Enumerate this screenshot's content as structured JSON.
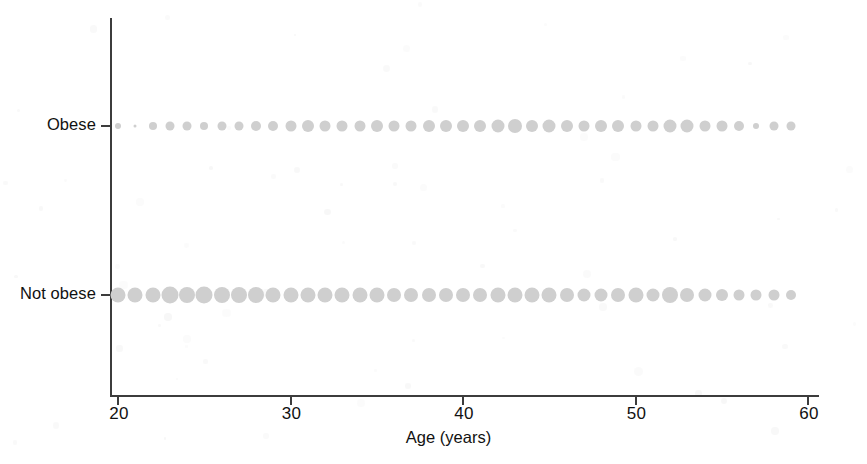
{
  "chart_data": {
    "type": "scatter",
    "title": "",
    "subtitle": "",
    "xlabel": "Age (years)",
    "ylabel": "",
    "xlim": [
      20,
      60
    ],
    "ylim_categories": [
      "Not obese",
      "Obese"
    ],
    "xticks": [
      20,
      30,
      40,
      50,
      60
    ],
    "xticklabels": [
      "20",
      "30",
      "40",
      "50",
      "60"
    ],
    "yticklabels": [
      "Obese",
      "Not obese"
    ],
    "grid": false,
    "legend": "none",
    "marker_color": "#cfcfcf",
    "axis_color": "#3c3c3c",
    "encoding_note": "Marker area encodes number of subjects at each integer age within each obesity category.",
    "x": [
      20,
      21,
      22,
      23,
      24,
      25,
      26,
      27,
      28,
      29,
      30,
      31,
      32,
      33,
      34,
      35,
      36,
      37,
      38,
      39,
      40,
      41,
      42,
      43,
      44,
      45,
      46,
      47,
      48,
      49,
      50,
      51,
      52,
      53,
      54,
      55,
      56,
      57,
      58,
      59
    ],
    "series": [
      {
        "name": "Obese",
        "y_category": "Obese",
        "sizes": [
          6,
          3,
          8,
          9,
          9,
          8,
          9,
          9,
          10,
          10,
          11,
          12,
          11,
          11,
          11,
          12,
          11,
          11,
          12,
          12,
          12,
          12,
          13,
          14,
          12,
          13,
          12,
          11,
          12,
          12,
          11,
          11,
          13,
          13,
          11,
          11,
          10,
          6,
          9,
          9
        ]
      },
      {
        "name": "Not obese",
        "y_category": "Not obese",
        "sizes": [
          15,
          15,
          15,
          17,
          16,
          17,
          16,
          16,
          16,
          15,
          15,
          15,
          15,
          15,
          15,
          15,
          14,
          14,
          14,
          14,
          14,
          14,
          15,
          15,
          15,
          15,
          14,
          13,
          13,
          14,
          15,
          13,
          16,
          14,
          13,
          12,
          11,
          11,
          11,
          10
        ]
      }
    ]
  },
  "axis": {
    "x_title": "Age (years)",
    "x_tick_labels": [
      "20",
      "30",
      "40",
      "50",
      "60"
    ],
    "y_tick_labels": [
      "Obese",
      "Not obese"
    ]
  }
}
